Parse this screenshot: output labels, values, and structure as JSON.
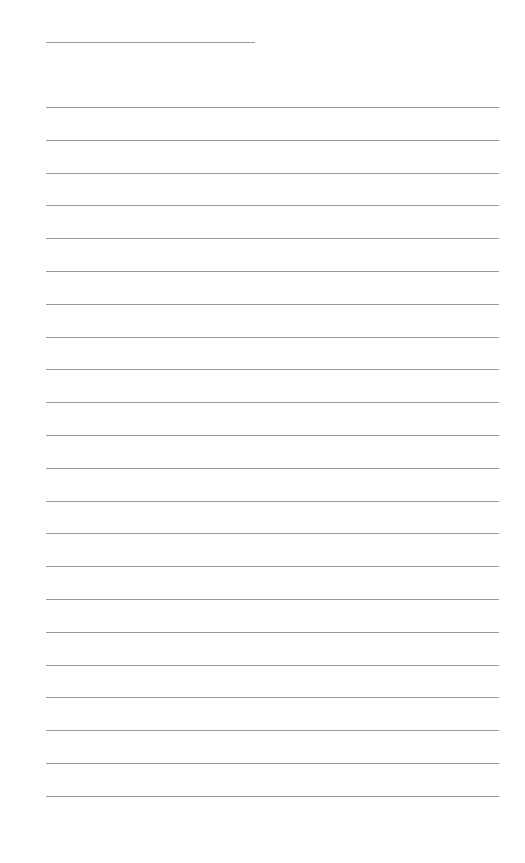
{
  "page": {
    "type": "lined-paper",
    "background_color": "#ffffff",
    "line_color": "#9c9c9c",
    "title_line": {
      "label": "",
      "text": ""
    },
    "ruled_lines": {
      "count": 22,
      "first_y": 107,
      "spacing": 32.8,
      "lines": [
        "",
        "",
        "",
        "",
        "",
        "",
        "",
        "",
        "",
        "",
        "",
        "",
        "",
        "",
        "",
        "",
        "",
        "",
        "",
        "",
        "",
        ""
      ]
    }
  }
}
